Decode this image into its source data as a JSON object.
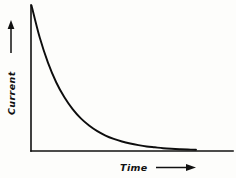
{
  "figure": {
    "background_color": "#fdfdfb",
    "ink_color": "#111111",
    "width": 236,
    "height": 178
  },
  "axes": {
    "y_axis_name": "current-axis",
    "x_axis_name": "time-axis",
    "y_label": "Current",
    "x_label": "Time",
    "y_arrow_direction": "up",
    "x_arrow_direction": "right"
  },
  "chart_data": {
    "type": "line",
    "title": "",
    "subtitle": "",
    "xlabel": "Time",
    "ylabel": "Current",
    "legend": [],
    "legend_position": "none",
    "grid": false,
    "xlim": [
      0,
      1
    ],
    "ylim": [
      0,
      1
    ],
    "x_tick_labels": [],
    "y_tick_labels": [],
    "annotations": [],
    "series": [
      {
        "name": "Capacitor discharge current",
        "description": "Exponential decay of current with time",
        "equation": "I = I0 * exp(-t / tau)",
        "x": [
          0.0,
          0.05,
          0.1,
          0.15,
          0.2,
          0.25,
          0.3,
          0.35,
          0.4,
          0.45,
          0.5,
          0.55,
          0.6,
          0.65,
          0.7,
          0.75,
          0.8,
          0.85,
          0.9,
          0.95,
          1.0
        ],
        "y": [
          1.0,
          0.779,
          0.607,
          0.472,
          0.368,
          0.287,
          0.223,
          0.174,
          0.135,
          0.105,
          0.082,
          0.064,
          0.05,
          0.039,
          0.03,
          0.024,
          0.018,
          0.014,
          0.011,
          0.009,
          0.007
        ]
      }
    ]
  }
}
